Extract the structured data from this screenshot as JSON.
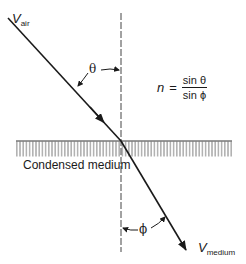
{
  "diagram": {
    "labels": {
      "incident_velocity_main": "V",
      "incident_velocity_sub": "air",
      "refracted_velocity_main": "V",
      "refracted_velocity_sub": "medium",
      "incident_angle": "θ",
      "refracted_angle": "ϕ",
      "medium": "Condensed medium"
    },
    "equation": {
      "lhs": "n",
      "equals": "=",
      "numerator": "sin θ",
      "denominator": "sin ϕ"
    },
    "colors": {
      "ink": "#1a1a1a",
      "hatch": "#555555",
      "normal_line": "#444444",
      "background": "#ffffff"
    }
  }
}
